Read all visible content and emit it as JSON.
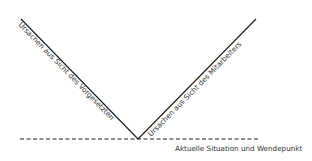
{
  "diagram": {
    "left_branch_label": "Ursachen aus Sicht des Vorgesetzten",
    "right_branch_label": "Ursachen aus Sicht des Mitarbeiters",
    "baseline_label": "Aktuelle Situation und Wendepunkt",
    "line_color": "#1a1a1a",
    "text_color": "#333333"
  }
}
